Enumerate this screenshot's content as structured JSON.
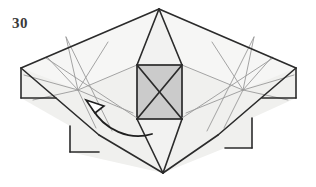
{
  "figure": {
    "step_number": "30",
    "kind": "origami-folding-diagram",
    "caption": "",
    "canvas": {
      "width": 316,
      "height": 187
    },
    "colors": {
      "background": "#ffffff",
      "paper_fill": "#f0f0ee",
      "paper_fill_light": "#f6f6f5",
      "center_panel_fill": "#cbcbcb",
      "outline": "#2b2b2b",
      "crease": "#9a9a9a",
      "crease_light": "#b5b5b5",
      "arrow": "#1f1f1f",
      "label": "#3a3a3a"
    },
    "line_widths": {
      "outline": 1.6,
      "center_panel": 1.7,
      "crease": 0.9,
      "arrow": 1.8
    },
    "shapes": {
      "body_outline": "159,9 296,68 296,98 252,118 252,148 225,148 163,173 70,152 70,126 21,98 21,68",
      "left_wing": "21,68 159,9 137,65 78,90",
      "right_wing": "296,68 159,9 182,65 243,90",
      "center_top_triangle": "159,9 137,65 182,65",
      "center_bottom_triangle": "163,173 137,119 182,119",
      "center_panel": {
        "x": 137,
        "y": 65,
        "width": 45,
        "height": 54
      }
    },
    "outline_edges": [
      {
        "name": "top-left-edge",
        "from": [
          21,
          68
        ],
        "to": [
          159,
          9
        ]
      },
      {
        "name": "top-right-edge",
        "from": [
          159,
          9
        ],
        "to": [
          296,
          68
        ]
      },
      {
        "name": "left-flap-vertical",
        "from": [
          21,
          68
        ],
        "to": [
          21,
          98
        ]
      },
      {
        "name": "left-flap-horizontal",
        "from": [
          21,
          98
        ],
        "to": [
          56,
          98
        ]
      },
      {
        "name": "right-flap-vertical",
        "from": [
          296,
          68
        ],
        "to": [
          296,
          98
        ]
      },
      {
        "name": "right-flap-horizontal",
        "from": [
          296,
          98
        ],
        "to": [
          262,
          98
        ]
      },
      {
        "name": "lower-left-edge",
        "from": [
          21,
          68
        ],
        "to": [
          99,
          135
        ]
      },
      {
        "name": "lower-left-to-bottom",
        "from": [
          99,
          135
        ],
        "to": [
          163,
          173
        ]
      },
      {
        "name": "lower-right-edge",
        "from": [
          296,
          68
        ],
        "to": [
          218,
          135
        ]
      },
      {
        "name": "lower-right-to-bottom",
        "from": [
          218,
          135
        ],
        "to": [
          163,
          173
        ]
      },
      {
        "name": "bottom-left-flap-vertical",
        "from": [
          70,
          126
        ],
        "to": [
          70,
          152
        ]
      },
      {
        "name": "bottom-left-flap-horizontal",
        "from": [
          70,
          152
        ],
        "to": [
          99,
          152
        ]
      },
      {
        "name": "bottom-right-flap-vertical",
        "from": [
          252,
          118
        ],
        "to": [
          252,
          148
        ]
      },
      {
        "name": "bottom-right-flap-horizontal",
        "from": [
          252,
          148
        ],
        "to": [
          225,
          148
        ]
      },
      {
        "name": "apex-to-panel-left",
        "from": [
          159,
          9
        ],
        "to": [
          137,
          65
        ]
      },
      {
        "name": "apex-to-panel-right",
        "from": [
          159,
          9
        ],
        "to": [
          182,
          65
        ]
      },
      {
        "name": "panel-left-to-bottom-apex",
        "from": [
          137,
          119
        ],
        "to": [
          163,
          173
        ]
      },
      {
        "name": "panel-right-to-bottom-apex",
        "from": [
          182,
          119
        ],
        "to": [
          163,
          173
        ]
      }
    ],
    "center_panel_diagonals": [
      {
        "name": "diagonal-nw-se",
        "from": [
          137,
          65
        ],
        "to": [
          182,
          119
        ]
      },
      {
        "name": "diagonal-sw-ne",
        "from": [
          137,
          119
        ],
        "to": [
          182,
          65
        ]
      }
    ],
    "crease_lines": [
      {
        "name": "left-crease-1",
        "from": [
          78,
          90
        ],
        "to": [
          47,
          57
        ]
      },
      {
        "name": "left-crease-2",
        "from": [
          78,
          90
        ],
        "to": [
          66,
          37
        ]
      },
      {
        "name": "left-crease-3",
        "from": [
          78,
          90
        ],
        "to": [
          108,
          42
        ]
      },
      {
        "name": "left-crease-4",
        "from": [
          78,
          90
        ],
        "to": [
          137,
          65
        ]
      },
      {
        "name": "left-crease-5",
        "from": [
          78,
          90
        ],
        "to": [
          133,
          113
        ]
      },
      {
        "name": "left-crease-6",
        "from": [
          78,
          90
        ],
        "to": [
          96,
          128
        ]
      },
      {
        "name": "left-crease-7",
        "from": [
          78,
          90
        ],
        "to": [
          33,
          100
        ]
      },
      {
        "name": "left-crease-8",
        "from": [
          78,
          90
        ],
        "to": [
          24,
          75
        ]
      },
      {
        "name": "left-long-crease",
        "from": [
          46,
          58
        ],
        "to": [
          137,
          118
        ]
      },
      {
        "name": "left-long-crease-2",
        "from": [
          66,
          37
        ],
        "to": [
          112,
          131
        ]
      },
      {
        "name": "right-crease-1",
        "from": [
          243,
          90
        ],
        "to": [
          272,
          57
        ]
      },
      {
        "name": "right-crease-2",
        "from": [
          243,
          90
        ],
        "to": [
          254,
          37
        ]
      },
      {
        "name": "right-crease-3",
        "from": [
          243,
          90
        ],
        "to": [
          212,
          42
        ]
      },
      {
        "name": "right-crease-4",
        "from": [
          243,
          90
        ],
        "to": [
          182,
          65
        ]
      },
      {
        "name": "right-crease-5",
        "from": [
          243,
          90
        ],
        "to": [
          186,
          113
        ]
      },
      {
        "name": "right-crease-6",
        "from": [
          243,
          90
        ],
        "to": [
          224,
          128
        ]
      },
      {
        "name": "right-crease-7",
        "from": [
          243,
          90
        ],
        "to": [
          288,
          100
        ]
      },
      {
        "name": "right-crease-8",
        "from": [
          243,
          90
        ],
        "to": [
          294,
          75
        ]
      },
      {
        "name": "right-long-crease",
        "from": [
          273,
          58
        ],
        "to": [
          182,
          118
        ]
      },
      {
        "name": "right-long-crease-2",
        "from": [
          254,
          37
        ],
        "to": [
          207,
          131
        ]
      }
    ],
    "arrow": {
      "name": "fold-arrow",
      "path": "M 152,134 C 130,141 104,130 92,108",
      "head_points": "86,100 104,106 95,113",
      "direction": "curved-right-to-left-upward",
      "style": "hollow-arrowhead"
    }
  }
}
